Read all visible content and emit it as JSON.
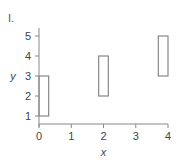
{
  "panel_label": "I.",
  "colors": {
    "axis": "#888888",
    "box_stroke": "#888888",
    "text": "#444444",
    "background": "#ffffff"
  },
  "chart_data": {
    "type": "range-bar",
    "title": "",
    "xlabel": "x",
    "ylabel": "y",
    "xlim": [
      0,
      4
    ],
    "ylim": [
      0.65,
      5.3
    ],
    "x_ticks": [
      "0",
      "1",
      "2",
      "3",
      "4"
    ],
    "y_ticks": [
      "1",
      "2",
      "3",
      "4",
      "5"
    ],
    "grid": false,
    "legend": null,
    "boxes": [
      {
        "x_start": 0.0,
        "x_end": 0.3,
        "y_low": 1,
        "y_high": 3
      },
      {
        "x_start": 1.85,
        "x_end": 2.15,
        "y_low": 2,
        "y_high": 4
      },
      {
        "x_start": 3.7,
        "x_end": 4.0,
        "y_low": 3,
        "y_high": 5
      }
    ]
  }
}
